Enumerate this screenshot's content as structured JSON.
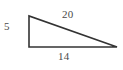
{
  "figure": {
    "type": "right-triangle-diagram",
    "background_color": "#ffffff",
    "stroke_color": "#333333",
    "label_color": "#4a4a4a",
    "canvas": {
      "width": 123,
      "height": 70
    },
    "vertices": {
      "apex": {
        "x": 29,
        "y": 16
      },
      "right_angle_corner": {
        "x": 29,
        "y": 47
      },
      "far_corner": {
        "x": 117,
        "y": 47
      }
    },
    "labels": {
      "vertical_leg": "5",
      "hypotenuse": "20",
      "base": "14"
    }
  },
  "chart_data": {
    "type": "diagram",
    "title": "",
    "shape": "right triangle",
    "categories": [
      "vertical leg",
      "base",
      "hypotenuse"
    ],
    "values": [
      5,
      14,
      20
    ],
    "annotations": [
      {
        "text": "5",
        "side": "vertical leg",
        "position": "left"
      },
      {
        "text": "20",
        "side": "hypotenuse",
        "position": "above"
      },
      {
        "text": "14",
        "side": "base",
        "position": "below"
      }
    ]
  }
}
